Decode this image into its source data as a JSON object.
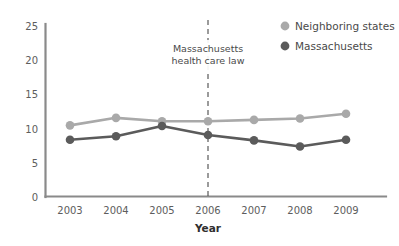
{
  "chart_data": {
    "type": "line",
    "title": "",
    "xlabel": "Year",
    "ylabel": "",
    "categories": [
      "2003",
      "2004",
      "2005",
      "2006",
      "2007",
      "2008",
      "2009"
    ],
    "x": [
      2003,
      2004,
      2005,
      2006,
      2007,
      2008,
      2009
    ],
    "xlim": [
      2003,
      2009
    ],
    "ylim": [
      0,
      25
    ],
    "y_ticks": [
      "0",
      "5",
      "10",
      "15",
      "20",
      "25"
    ],
    "y_tick_values": [
      0,
      5,
      10,
      15,
      20,
      25
    ],
    "grid": false,
    "legend_position": "top-right",
    "series": [
      {
        "name": "Neighboring states",
        "color": "#a9a9a9",
        "values": [
          10.4,
          11.5,
          11.0,
          11.0,
          11.2,
          11.4,
          12.1
        ]
      },
      {
        "name": "Massachusetts",
        "color": "#5b5b5b",
        "values": [
          8.3,
          8.8,
          10.3,
          9.0,
          8.2,
          7.3,
          8.3
        ]
      }
    ],
    "annotations": [
      {
        "name": "massachusetts-health-care-law",
        "line1": "Massachusetts",
        "line2": "health care law",
        "at_x": 2006,
        "marker": "dashed-vertical-line"
      }
    ]
  },
  "axes": {
    "x_axis_label": "Year",
    "y_ticks": [
      "25",
      "20",
      "15",
      "10",
      "5",
      "0"
    ],
    "x_ticks": [
      "2003",
      "2004",
      "2005",
      "2006",
      "2007",
      "2008",
      "2009"
    ]
  },
  "legend": {
    "items": [
      {
        "label": "Neighboring states",
        "color": "#a9a9a9"
      },
      {
        "label": "Massachusetts",
        "color": "#5b5b5b"
      }
    ]
  },
  "annotation": {
    "line1": "Massachusetts",
    "line2": "health care law"
  },
  "colors": {
    "series_light": "#a9a9a9",
    "series_dark": "#5b5b5b",
    "axis": "#7a7a7a",
    "text": "#4a4a4a",
    "background": "#ffffff"
  }
}
